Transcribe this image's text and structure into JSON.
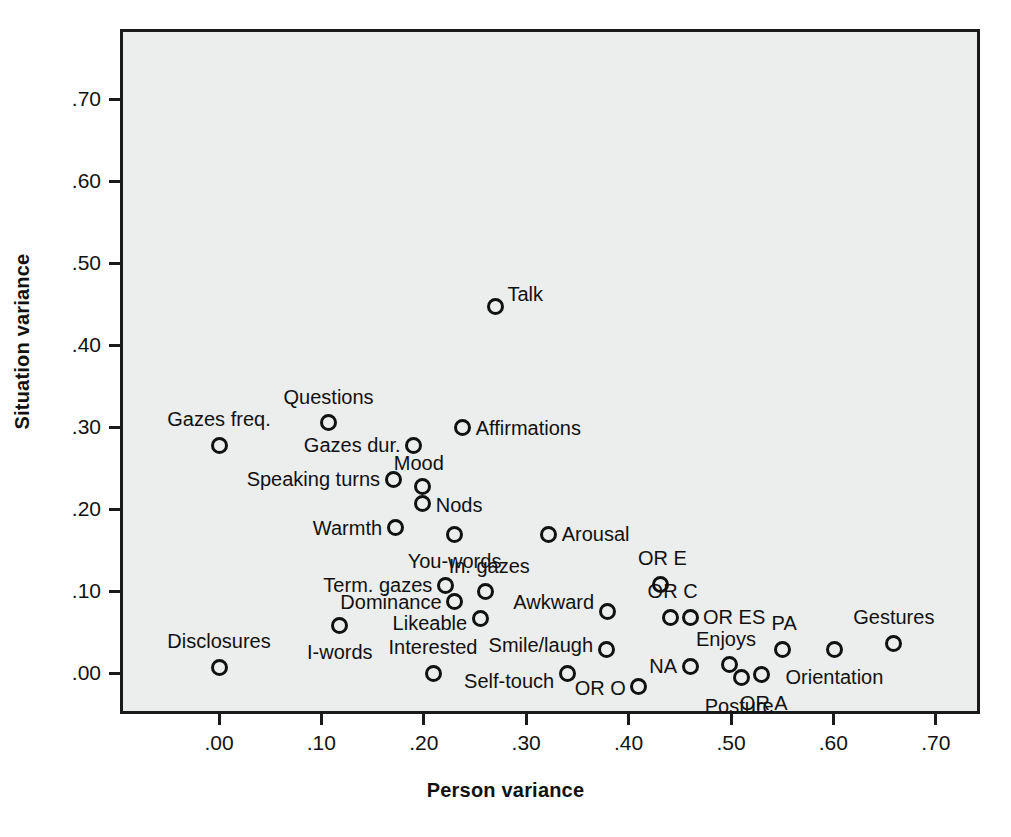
{
  "chart_data": {
    "type": "scatter",
    "title": "",
    "xlabel": "Person variance",
    "ylabel": "Situation variance",
    "xlim": [
      -0.04,
      0.75
    ],
    "ylim": [
      -0.05,
      0.79
    ],
    "xticks": [
      ".00",
      ".10",
      ".20",
      ".30",
      ".40",
      ".50",
      ".60",
      ".70"
    ],
    "xtick_values": [
      0.0,
      0.1,
      0.2,
      0.3,
      0.4,
      0.5,
      0.6,
      0.7
    ],
    "yticks": [
      ".00",
      ".10",
      ".20",
      ".30",
      ".40",
      ".50",
      ".60",
      ".70"
    ],
    "ytick_values": [
      0.0,
      0.1,
      0.2,
      0.3,
      0.4,
      0.5,
      0.6,
      0.7
    ],
    "grid": false,
    "legend": null,
    "plot_background": "#eceded",
    "marker_color": "#111111",
    "marker_style": "open-circle",
    "points": [
      {
        "label": "Talk",
        "x": 0.27,
        "y": 0.447,
        "lx": 12,
        "ly": -12,
        "anchor": "left"
      },
      {
        "label": "Questions",
        "x": 0.107,
        "y": 0.305,
        "lx": 0,
        "ly": -16,
        "anchor": "above"
      },
      {
        "label": "Affirmations",
        "x": 0.238,
        "y": 0.299,
        "lx": 13,
        "ly": 0,
        "anchor": "left"
      },
      {
        "label": "Gazes freq.",
        "x": 0.0,
        "y": 0.278,
        "lx": 0,
        "ly": -16,
        "anchor": "above"
      },
      {
        "label": "Gazes dur.",
        "x": 0.19,
        "y": 0.278,
        "lx": -13,
        "ly": 0,
        "anchor": "right"
      },
      {
        "label": "Speaking turns",
        "x": 0.17,
        "y": 0.236,
        "lx": -13,
        "ly": 0,
        "anchor": "right"
      },
      {
        "label": "Mood",
        "x": 0.199,
        "y": 0.227,
        "lx": -4,
        "ly": -14,
        "anchor": "above"
      },
      {
        "label": "Nods",
        "x": 0.199,
        "y": 0.207,
        "lx": 13,
        "ly": 2,
        "anchor": "left"
      },
      {
        "label": "Warmth",
        "x": 0.172,
        "y": 0.177,
        "lx": -13,
        "ly": 0,
        "anchor": "right"
      },
      {
        "label": "You-words",
        "x": 0.23,
        "y": 0.169,
        "lx": 0,
        "ly": 17,
        "anchor": "below"
      },
      {
        "label": "Arousal",
        "x": 0.322,
        "y": 0.169,
        "lx": 13,
        "ly": 0,
        "anchor": "left"
      },
      {
        "label": "OR E",
        "x": 0.431,
        "y": 0.108,
        "lx": 2,
        "ly": -16,
        "anchor": "above"
      },
      {
        "label": "Term. gazes",
        "x": 0.221,
        "y": 0.107,
        "lx": -13,
        "ly": 0,
        "anchor": "right"
      },
      {
        "label": "In. gazes",
        "x": 0.26,
        "y": 0.099,
        "lx": 4,
        "ly": -16,
        "anchor": "above"
      },
      {
        "label": "Dominance",
        "x": 0.23,
        "y": 0.087,
        "lx": -13,
        "ly": 0,
        "anchor": "right"
      },
      {
        "label": "Awkward",
        "x": 0.379,
        "y": 0.075,
        "lx": -13,
        "ly": -10,
        "anchor": "right"
      },
      {
        "label": "OR C",
        "x": 0.441,
        "y": 0.068,
        "lx": 2,
        "ly": -16,
        "anchor": "above"
      },
      {
        "label": "OR ES",
        "x": 0.46,
        "y": 0.068,
        "lx": 13,
        "ly": 0,
        "anchor": "left"
      },
      {
        "label": "Likeable",
        "x": 0.255,
        "y": 0.067,
        "lx": -13,
        "ly": 5,
        "anchor": "right"
      },
      {
        "label": "I-words",
        "x": 0.118,
        "y": 0.058,
        "lx": 0,
        "ly": 17,
        "anchor": "below"
      },
      {
        "label": "Gestures",
        "x": 0.659,
        "y": 0.036,
        "lx": 0,
        "ly": -16,
        "anchor": "above"
      },
      {
        "label": "Smile/laugh",
        "x": 0.378,
        "y": 0.029,
        "lx": -13,
        "ly": -4,
        "anchor": "right"
      },
      {
        "label": "PA",
        "x": 0.55,
        "y": 0.029,
        "lx": 2,
        "ly": -16,
        "anchor": "above"
      },
      {
        "label": "Orientation",
        "x": 0.601,
        "y": 0.029,
        "lx": 0,
        "ly": 18,
        "anchor": "below"
      },
      {
        "label": "Enjoys",
        "x": 0.499,
        "y": 0.01,
        "lx": -4,
        "ly": -16,
        "anchor": "above"
      },
      {
        "label": "NA",
        "x": 0.46,
        "y": 0.008,
        "lx": -13,
        "ly": 0,
        "anchor": "right"
      },
      {
        "label": "Disclosures",
        "x": 0.0,
        "y": 0.007,
        "lx": 0,
        "ly": -16,
        "anchor": "above"
      },
      {
        "label": "Self-touch",
        "x": 0.34,
        "y": 0.0,
        "lx": -13,
        "ly": 8,
        "anchor": "right"
      },
      {
        "label": "Interested",
        "x": 0.209,
        "y": 0.0,
        "lx": 0,
        "ly": -16,
        "anchor": "above"
      },
      {
        "label": "OR A",
        "x": 0.53,
        "y": -0.002,
        "lx": 2,
        "ly": 18,
        "anchor": "below"
      },
      {
        "label": "Posture",
        "x": 0.51,
        "y": -0.005,
        "lx": -2,
        "ly": 19,
        "anchor": "below"
      },
      {
        "label": "OR O",
        "x": 0.41,
        "y": -0.016,
        "lx": -13,
        "ly": 2,
        "anchor": "right"
      }
    ]
  },
  "geometry": {
    "plot_left": 120,
    "plot_top": 29,
    "plot_width": 860,
    "plot_height": 685,
    "x_origin_px": 219,
    "y_origin_px": 673,
    "px_per_x_unit": 1024,
    "px_per_y_unit": 820
  }
}
